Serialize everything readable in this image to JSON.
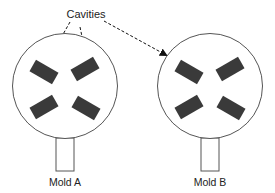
{
  "diagram": {
    "callout_label": "Cavities",
    "molds": [
      {
        "label": "Mold A",
        "cavity_count": 4
      },
      {
        "label": "Mold B",
        "cavity_count": 4
      }
    ],
    "colors": {
      "outline": "#555555",
      "cavity_fill": "#3a3a3a",
      "text": "#222222"
    }
  }
}
